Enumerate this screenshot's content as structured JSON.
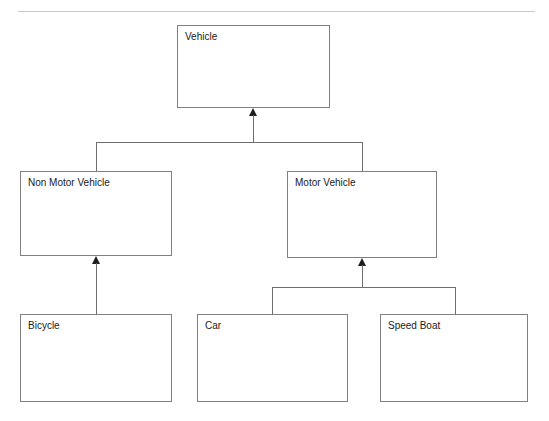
{
  "page": {
    "width": 549,
    "height": 421,
    "background": "#ffffff"
  },
  "header": {
    "left_text": "",
    "right_text": "",
    "rule_color": "#c9c9c9"
  },
  "diagram": {
    "type": "uml-class-diagram",
    "box_border_color": "#808080",
    "connector_color": "#6e6e6e",
    "arrowhead_color": "#1e1e1e",
    "arrowhead_style": "filled-triangle",
    "relationship": "generalization",
    "nodes": [
      {
        "id": "vehicle",
        "label": "Vehicle",
        "x": 177,
        "y": 25,
        "w": 153,
        "h": 83
      },
      {
        "id": "non-motor-vehicle",
        "label": "Non Motor Vehicle",
        "x": 20,
        "y": 171,
        "w": 152,
        "h": 85
      },
      {
        "id": "motor-vehicle",
        "label": "Motor Vehicle",
        "x": 287,
        "y": 171,
        "w": 150,
        "h": 87
      },
      {
        "id": "bicycle",
        "label": "Bicycle",
        "x": 20,
        "y": 314,
        "w": 152,
        "h": 88
      },
      {
        "id": "car",
        "label": "Car",
        "x": 197,
        "y": 314,
        "w": 151,
        "h": 88
      },
      {
        "id": "speed-boat",
        "label": "Speed Boat",
        "x": 380,
        "y": 314,
        "w": 148,
        "h": 88
      }
    ],
    "edges": [
      {
        "id": "edge-nonmotor-to-vehicle",
        "from": "non-motor-vehicle",
        "to": "vehicle"
      },
      {
        "id": "edge-motor-to-vehicle",
        "from": "motor-vehicle",
        "to": "vehicle"
      },
      {
        "id": "edge-bicycle-to-nonmotor",
        "from": "bicycle",
        "to": "non-motor-vehicle"
      },
      {
        "id": "edge-car-to-motor",
        "from": "car",
        "to": "motor-vehicle"
      },
      {
        "id": "edge-speedboat-to-motor",
        "from": "speed-boat",
        "to": "motor-vehicle"
      }
    ]
  }
}
